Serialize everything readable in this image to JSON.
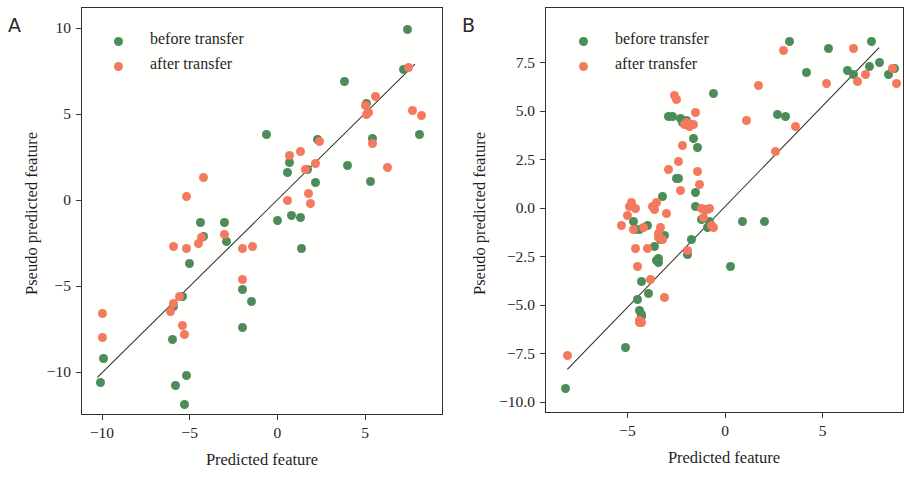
{
  "figure": {
    "colors": {
      "before": "#4c8c5a",
      "after": "#f4795e",
      "line": "#2a2a2a",
      "frame": "#2f2f2f"
    },
    "legend_labels": {
      "before": "before transfer",
      "after": "after transfer"
    }
  },
  "chart_data": [
    {
      "type": "scatter",
      "panel_label": "A",
      "title": "",
      "xlabel": "Predicted feature",
      "ylabel": "Pseudo predicted feature",
      "xlim": [
        -11.4,
        8.5
      ],
      "ylim": [
        -12.6,
        11.3
      ],
      "xticks": [
        -10,
        -5,
        0,
        5
      ],
      "xtick_labels": [
        "−10",
        "−5",
        "0",
        "5"
      ],
      "yticks": [
        10,
        5,
        0,
        -5,
        -10
      ],
      "ytick_labels": [
        "10",
        "5",
        "0",
        "−5",
        "−10"
      ],
      "grid": false,
      "legend_position": "upper left",
      "fit_line": {
        "x0": -10.3,
        "y0": -10.3,
        "x1": 7.8,
        "y1": 7.9
      },
      "series": [
        {
          "name": "before transfer",
          "color": "#4c8c5a",
          "points": [
            [
              -10.1,
              -10.6
            ],
            [
              -9.9,
              -9.2
            ],
            [
              -6.0,
              -8.1
            ],
            [
              -5.9,
              -6.2
            ],
            [
              -5.8,
              -10.8
            ],
            [
              -5.4,
              -5.6
            ],
            [
              -5.3,
              -11.9
            ],
            [
              -5.2,
              -10.2
            ],
            [
              -5.0,
              -3.7
            ],
            [
              -4.4,
              -1.3
            ],
            [
              -4.2,
              -2.1
            ],
            [
              -3.0,
              -1.3
            ],
            [
              -2.9,
              -2.4
            ],
            [
              -2.0,
              -5.2
            ],
            [
              -2.0,
              -7.4
            ],
            [
              -1.5,
              -5.9
            ],
            [
              -0.6,
              3.8
            ],
            [
              0.0,
              -1.2
            ],
            [
              0.6,
              1.6
            ],
            [
              0.7,
              2.2
            ],
            [
              0.8,
              -0.9
            ],
            [
              1.3,
              -1.0
            ],
            [
              1.4,
              -2.8
            ],
            [
              1.7,
              1.8
            ],
            [
              2.2,
              1.0
            ],
            [
              2.3,
              3.5
            ],
            [
              3.8,
              6.9
            ],
            [
              4.0,
              2.0
            ],
            [
              5.1,
              5.6
            ],
            [
              5.3,
              1.1
            ],
            [
              5.4,
              3.6
            ],
            [
              7.2,
              7.6
            ],
            [
              7.4,
              9.9
            ],
            [
              8.1,
              3.8
            ]
          ]
        },
        {
          "name": "after transfer",
          "color": "#f4795e",
          "points": [
            [
              -10.0,
              -6.6
            ],
            [
              -10.0,
              -8.0
            ],
            [
              -6.1,
              -6.5
            ],
            [
              -5.9,
              -6.0
            ],
            [
              -5.9,
              -2.7
            ],
            [
              -5.6,
              -5.6
            ],
            [
              -5.4,
              -7.3
            ],
            [
              -5.3,
              -7.8
            ],
            [
              -5.2,
              0.2
            ],
            [
              -5.2,
              -2.8
            ],
            [
              -4.5,
              -2.5
            ],
            [
              -4.3,
              -2.2
            ],
            [
              -4.2,
              1.3
            ],
            [
              -3.0,
              -2.0
            ],
            [
              -2.0,
              -4.6
            ],
            [
              -2.0,
              -2.8
            ],
            [
              -1.4,
              -2.7
            ],
            [
              0.6,
              0.0
            ],
            [
              0.7,
              2.6
            ],
            [
              1.3,
              2.8
            ],
            [
              1.6,
              1.8
            ],
            [
              1.8,
              0.4
            ],
            [
              1.9,
              -0.2
            ],
            [
              2.2,
              2.1
            ],
            [
              2.4,
              3.4
            ],
            [
              5.0,
              5.5
            ],
            [
              5.1,
              5.0
            ],
            [
              5.2,
              5.1
            ],
            [
              5.4,
              3.3
            ],
            [
              5.6,
              6.0
            ],
            [
              6.3,
              1.9
            ],
            [
              7.5,
              7.7
            ],
            [
              7.7,
              5.2
            ],
            [
              8.2,
              4.9
            ]
          ]
        }
      ]
    },
    {
      "type": "scatter",
      "panel_label": "B",
      "title": "",
      "xlabel": "Predicted feature",
      "ylabel": "Pseudo predicted feature",
      "xlim": [
        -8.9,
        9.2
      ],
      "ylim": [
        -10.5,
        9.1
      ],
      "xticks": [
        -5,
        0,
        5
      ],
      "xtick_labels": [
        "−5",
        "0",
        "5"
      ],
      "yticks": [
        7.5,
        5.0,
        2.5,
        0.0,
        -2.5,
        -5.0,
        -7.5,
        -10.0
      ],
      "ytick_labels": [
        "7.5",
        "5.0",
        "2.5",
        "0.0",
        "−2.5",
        "−5.0",
        "−7.5",
        "−10.0"
      ],
      "grid": false,
      "legend_position": "upper left",
      "fit_line": {
        "x0": -8.1,
        "y0": -8.3,
        "x1": 7.9,
        "y1": 8.3
      },
      "series": [
        {
          "name": "before transfer",
          "color": "#4c8c5a",
          "points": [
            [
              -8.2,
              -9.3
            ],
            [
              -5.1,
              -7.2
            ],
            [
              -4.7,
              -0.7
            ],
            [
              -4.6,
              -1.1
            ],
            [
              -4.5,
              -4.7
            ],
            [
              -4.4,
              -1.1
            ],
            [
              -4.4,
              -5.3
            ],
            [
              -4.3,
              -5.5
            ],
            [
              -4.3,
              -3.8
            ],
            [
              -4.3,
              -5.6
            ],
            [
              -4.0,
              -0.9
            ],
            [
              -3.9,
              -4.4
            ],
            [
              -3.6,
              -2.0
            ],
            [
              -3.5,
              -2.7
            ],
            [
              -3.4,
              -2.8
            ],
            [
              -3.4,
              -2.6
            ],
            [
              -3.3,
              -1.6
            ],
            [
              -3.2,
              0.6
            ],
            [
              -3.1,
              -1.4
            ],
            [
              -2.9,
              4.7
            ],
            [
              -2.7,
              4.7
            ],
            [
              -2.5,
              1.5
            ],
            [
              -2.4,
              1.5
            ],
            [
              -2.3,
              4.6
            ],
            [
              -2.2,
              4.4
            ],
            [
              -2.0,
              4.5
            ],
            [
              -1.9,
              -2.4
            ],
            [
              -1.7,
              -1.6
            ],
            [
              -1.6,
              3.6
            ],
            [
              -1.5,
              0.1
            ],
            [
              -1.5,
              0.8
            ],
            [
              -1.4,
              3.1
            ],
            [
              -1.2,
              -0.6
            ],
            [
              -1.0,
              -0.1
            ],
            [
              -0.9,
              -1.0
            ],
            [
              -0.8,
              -0.7
            ],
            [
              -0.6,
              5.9
            ],
            [
              0.3,
              -3.0
            ],
            [
              0.9,
              -0.7
            ],
            [
              2.0,
              -0.7
            ],
            [
              2.7,
              4.8
            ],
            [
              3.1,
              4.7
            ],
            [
              3.3,
              8.6
            ],
            [
              4.2,
              7.0
            ],
            [
              5.3,
              8.2
            ],
            [
              6.3,
              7.1
            ],
            [
              6.6,
              6.9
            ],
            [
              7.4,
              7.3
            ],
            [
              7.5,
              8.6
            ],
            [
              7.9,
              7.5
            ],
            [
              8.4,
              6.9
            ],
            [
              8.7,
              7.2
            ]
          ]
        },
        {
          "name": "after transfer",
          "color": "#f4795e",
          "points": [
            [
              -8.1,
              -7.6
            ],
            [
              -5.3,
              -0.9
            ],
            [
              -5.0,
              -0.4
            ],
            [
              -4.9,
              0.1
            ],
            [
              -4.8,
              0.3
            ],
            [
              -4.7,
              -1.1
            ],
            [
              -4.6,
              0.0
            ],
            [
              -4.6,
              -2.1
            ],
            [
              -4.5,
              -3.0
            ],
            [
              -4.4,
              -5.8
            ],
            [
              -4.4,
              -5.9
            ],
            [
              -4.3,
              -5.9
            ],
            [
              -4.2,
              -1.0
            ],
            [
              -4.0,
              -2.1
            ],
            [
              -3.8,
              -3.7
            ],
            [
              -3.7,
              0.1
            ],
            [
              -3.6,
              -0.1
            ],
            [
              -3.5,
              0.3
            ],
            [
              -3.4,
              -1.3
            ],
            [
              -3.4,
              -1.5
            ],
            [
              -3.3,
              -1.0
            ],
            [
              -3.2,
              -1.6
            ],
            [
              -3.1,
              -4.6
            ],
            [
              -3.0,
              -0.3
            ],
            [
              -2.9,
              2.0
            ],
            [
              -2.6,
              5.8
            ],
            [
              -2.5,
              5.6
            ],
            [
              -2.4,
              2.4
            ],
            [
              -2.3,
              0.9
            ],
            [
              -2.2,
              3.2
            ],
            [
              -2.1,
              4.3
            ],
            [
              -2.0,
              4.4
            ],
            [
              -1.9,
              -2.2
            ],
            [
              -1.8,
              4.2
            ],
            [
              -1.7,
              4.3
            ],
            [
              -1.6,
              4.3
            ],
            [
              -1.5,
              4.9
            ],
            [
              -1.4,
              1.9
            ],
            [
              -1.3,
              1.2
            ],
            [
              -1.2,
              0.0
            ],
            [
              -1.1,
              -0.5
            ],
            [
              -0.9,
              -0.1
            ],
            [
              -0.8,
              0.0
            ],
            [
              -0.7,
              -0.9
            ],
            [
              -0.6,
              -1.0
            ],
            [
              1.1,
              4.5
            ],
            [
              1.7,
              6.3
            ],
            [
              2.6,
              2.9
            ],
            [
              3.0,
              8.1
            ],
            [
              3.6,
              4.2
            ],
            [
              5.2,
              6.4
            ],
            [
              6.6,
              8.2
            ],
            [
              6.8,
              6.5
            ],
            [
              7.2,
              6.9
            ],
            [
              8.6,
              7.2
            ],
            [
              8.8,
              6.4
            ]
          ]
        }
      ]
    }
  ]
}
